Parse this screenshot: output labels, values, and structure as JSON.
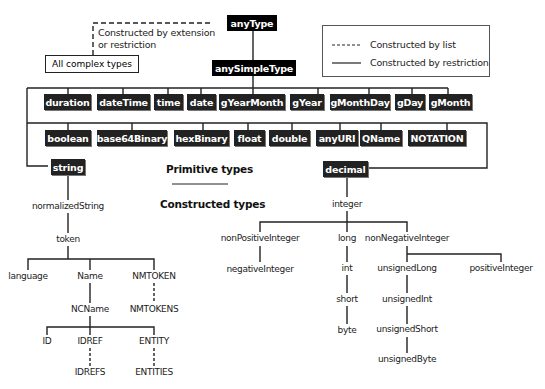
{
  "root": {
    "anyType": "anyType",
    "anySimpleType": "anySimpleType"
  },
  "complex": {
    "label": "All complex types",
    "edge_label_1": "Constructed by extension",
    "edge_label_2": "or restriction"
  },
  "legend": {
    "list": "Constructed by list",
    "restriction": "Constructed by restriction"
  },
  "primitives_row1": [
    "duration",
    "dateTime",
    "time",
    "date",
    "gYearMonth",
    "gYear",
    "gMonthDay",
    "gDay",
    "gMonth"
  ],
  "primitives_row2": [
    "boolean",
    "base64Binary",
    "hexBinary",
    "float",
    "double",
    "anyURI",
    "QName",
    "NOTATION"
  ],
  "primitives_row3": {
    "string": "string",
    "decimal": "decimal"
  },
  "headings": {
    "primitive": "Primitive types",
    "constructed": "Constructed types"
  },
  "string_tree": {
    "normalizedString": "normalizedString",
    "token": "token",
    "language": "language",
    "Name": "Name",
    "NMTOKEN": "NMTOKEN",
    "NCName": "NCName",
    "NMTOKENS": "NMTOKENS",
    "ID": "ID",
    "IDREF": "IDREF",
    "ENTITY": "ENTITY",
    "IDREFS": "IDREFS",
    "ENTITIES": "ENTITIES"
  },
  "decimal_tree": {
    "integer": "integer",
    "nonPositiveInteger": "nonPositiveInteger",
    "negativeInteger": "negativeInteger",
    "long": "long",
    "int": "int",
    "short": "short",
    "byte": "byte",
    "nonNegativeInteger": "nonNegativeInteger",
    "unsignedLong": "unsignedLong",
    "unsignedInt": "unsignedInt",
    "unsignedShort": "unsignedShort",
    "unsignedByte": "unsignedByte",
    "positiveInteger": "positiveInteger"
  }
}
